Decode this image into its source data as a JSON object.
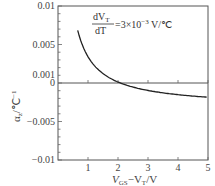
{
  "chart_data": {
    "type": "line",
    "title": "",
    "xlabel": "V_GS−V_T/V",
    "ylabel": "α_z/°C⁻¹",
    "xlim": [
      0,
      5
    ],
    "ylim": [
      -0.01,
      0.01
    ],
    "grid": false,
    "legend": null,
    "x_ticks": [
      "1",
      "2",
      "3",
      "4",
      "5"
    ],
    "y_ticks": [
      "0.01",
      "0.005",
      "0.001",
      "0",
      "−0.005",
      "−0.01"
    ],
    "annotation": {
      "numerator": "dV_T",
      "denominator": "dT",
      "value": "=3×10⁻³ V/℃"
    },
    "series": [
      {
        "name": "α_z",
        "x": [
          0.5,
          0.6,
          0.7,
          0.8,
          1.0,
          1.2,
          1.5,
          2.0,
          2.1,
          2.5,
          3.0,
          3.5,
          4.0,
          4.5,
          5.0
        ],
        "values": [
          0.01,
          0.0078,
          0.0062,
          0.0051,
          0.0035,
          0.0024,
          0.0013,
          0.0002,
          0.0,
          -0.0006,
          -0.001,
          -0.0012,
          -0.0014,
          -0.0015,
          -0.0016
        ]
      }
    ],
    "zero_line": true
  },
  "labels": {
    "y_axis": "α",
    "y_axis_sub": "z",
    "y_axis_unit": "/℃",
    "y_axis_sup": "−1",
    "x_axis_v": "V",
    "x_axis_gs": "GS",
    "x_axis_mid": "−V",
    "x_axis_t": "T",
    "x_axis_unit": "/V",
    "anno_num_d": "dV",
    "anno_num_sub": "T",
    "anno_den": "dT",
    "anno_value": "=3×10",
    "anno_exp": "−3",
    "anno_unit": " V/℃"
  }
}
